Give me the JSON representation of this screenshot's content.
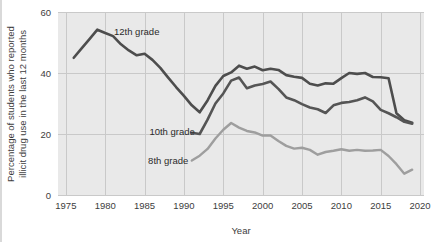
{
  "figure": {
    "background_color": "#ffffff",
    "plot_background_color": "#e9e9e9",
    "gridline_color": "#c9c9c9"
  },
  "chart_data": {
    "type": "line",
    "title": "",
    "subtitle": "",
    "xlabel": "Year",
    "ylabel": "Percentage of students who reported illicit drug use in the last 12 months",
    "ylabel_line1": "Percentage of students who reported",
    "ylabel_line2": "illicit drug use in the last 12 months",
    "xlim": [
      1974,
      2020.5
    ],
    "ylim": [
      0,
      60
    ],
    "xticks": [
      1975,
      1980,
      1985,
      1990,
      1995,
      2000,
      2005,
      2010,
      2015,
      2020
    ],
    "xtick_labels": [
      "1975",
      "1980",
      "1985",
      "1990",
      "1995",
      "2000",
      "2005",
      "2010",
      "2015",
      "2020"
    ],
    "yticks": [
      0,
      20,
      40,
      60
    ],
    "ytick_labels": [
      "0",
      "20",
      "40",
      "60"
    ],
    "grid": true,
    "grid_axis": "both",
    "legend_position": "inline-annotations",
    "series": [
      {
        "name": "12th grade",
        "label": "12th grade",
        "color": "#4d4d4d",
        "line_width": 2.6,
        "label_x": 1984.0,
        "label_y": 53.5,
        "x": [
          1976,
          1977,
          1978,
          1979,
          1980,
          1981,
          1982,
          1983,
          1984,
          1985,
          1986,
          1987,
          1988,
          1989,
          1990,
          1991,
          1992,
          1993,
          1994,
          1995,
          1996,
          1997,
          1998,
          1999,
          2000,
          2001,
          2002,
          2003,
          2004,
          2005,
          2006,
          2007,
          2008,
          2009,
          2010,
          2011,
          2012,
          2013,
          2014,
          2015,
          2016,
          2017,
          2018,
          2019
        ],
        "y": [
          45.0,
          48.1,
          51.1,
          54.2,
          53.1,
          52.1,
          49.4,
          47.4,
          45.8,
          46.3,
          44.3,
          41.7,
          38.5,
          35.4,
          32.5,
          29.4,
          27.1,
          31.0,
          35.8,
          39.0,
          40.2,
          42.4,
          41.4,
          42.1,
          40.9,
          41.4,
          41.0,
          39.3,
          38.8,
          38.4,
          36.5,
          35.9,
          36.6,
          36.5,
          38.3,
          40.0,
          39.7,
          40.0,
          38.7,
          38.6,
          38.3,
          26.8,
          24.5,
          23.7
        ]
      },
      {
        "name": "10th grade",
        "label": "10th grade",
        "color": "#555555",
        "line_width": 2.6,
        "label_x": 1988.5,
        "label_y": 21.0,
        "x": [
          1991,
          1992,
          1993,
          1994,
          1995,
          1996,
          1997,
          1998,
          1999,
          2000,
          2001,
          2002,
          2003,
          2004,
          2005,
          2006,
          2007,
          2008,
          2009,
          2010,
          2011,
          2012,
          2013,
          2014,
          2015,
          2016,
          2017,
          2018,
          2019
        ],
        "y": [
          20.4,
          20.0,
          24.7,
          30.0,
          33.3,
          37.5,
          38.5,
          35.0,
          35.9,
          36.4,
          37.2,
          34.8,
          32.0,
          31.1,
          29.8,
          28.7,
          28.1,
          26.9,
          29.4,
          30.2,
          30.5,
          31.1,
          32.0,
          30.7,
          27.9,
          26.8,
          25.5,
          24.0,
          23.4
        ]
      },
      {
        "name": "8th grade",
        "label": "8th grade",
        "color": "#9e9e9e",
        "line_width": 2.4,
        "label_x": 1988.0,
        "label_y": 11.5,
        "x": [
          1991,
          1992,
          1993,
          1994,
          1995,
          1996,
          1997,
          1998,
          1999,
          2000,
          2001,
          2002,
          2003,
          2004,
          2005,
          2006,
          2007,
          2008,
          2009,
          2010,
          2011,
          2012,
          2013,
          2014,
          2015,
          2016,
          2017,
          2018,
          2019
        ],
        "y": [
          11.3,
          12.9,
          15.1,
          18.5,
          21.4,
          23.6,
          22.1,
          21.0,
          20.5,
          19.5,
          19.5,
          17.7,
          16.1,
          15.2,
          15.5,
          14.8,
          13.2,
          14.1,
          14.5,
          15.0,
          14.5,
          14.8,
          14.5,
          14.6,
          14.8,
          12.8,
          10.1,
          7.0,
          8.3
        ]
      }
    ]
  },
  "axes": {
    "x_axis_title": "Year",
    "y_axis_title_line1": "Percentage of students who reported",
    "y_axis_title_line2": "illicit drug use in the last 12 months"
  }
}
